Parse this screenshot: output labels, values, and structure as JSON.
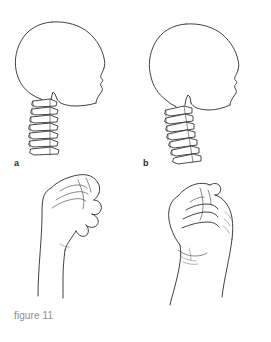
{
  "figure": {
    "caption": "figure 11",
    "caption_color": "#8d8d8d",
    "ink_color": "#2b2b2b",
    "background_color": "#ffffff",
    "width": 271,
    "height": 342,
    "style": "black-and-white line drawing / anatomical illustration"
  },
  "panels": [
    {
      "key": "a",
      "label": "a",
      "position": "left",
      "top_subject": "skull-profile-with-neutral-cervical-spine",
      "bottom_subject": "hand-loose-fist-profile-extended-wrist"
    },
    {
      "key": "b",
      "label": "b",
      "position": "right",
      "top_subject": "skull-profile-with-forward-tilted-cervical-spine",
      "bottom_subject": "hand-clenched-fist-profile-flexed-wrist"
    }
  ],
  "drawings": {
    "skull_left": {
      "name": "skull-profile-left",
      "facing": "right",
      "vertebrae_count": 7,
      "spine_alignment": "vertical"
    },
    "skull_right": {
      "name": "skull-profile-right",
      "facing": "right",
      "vertebrae_count": 7,
      "spine_alignment": "tilted-forward"
    },
    "hand_left": {
      "name": "hand-open-fist-left",
      "orientation": "thumb-up",
      "fingers_visible": 4
    },
    "hand_right": {
      "name": "hand-clenched-fist-right",
      "orientation": "thumb-up",
      "fingers_visible": 4
    }
  }
}
